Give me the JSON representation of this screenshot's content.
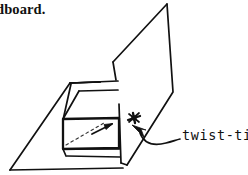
{
  "figure": {
    "name": "cardboard-box-twist-tie-diagram",
    "style": "hand-drawn line illustration",
    "background_color": "#ffffff",
    "ink_color": "#111111"
  },
  "caption": {
    "text": "dboard.",
    "note": "clipped text at top-left edge of the image"
  },
  "labels": {
    "twist_tie": "twist-tie"
  },
  "icons": {
    "twist_tie_knot": "star-knot-icon",
    "pointer": "arrowhead-icon",
    "direction": "arrow-icon"
  },
  "parts": {
    "base_panel": "base-panel",
    "upright_flap": "upright-flap",
    "box_body": "box-body",
    "box_lid_edge": "box-lid-edge",
    "hidden_edge": "dashed-hidden-edge",
    "leader_line": "leader-line"
  }
}
